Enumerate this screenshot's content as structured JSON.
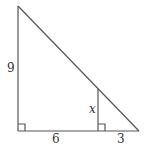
{
  "diagram": {
    "type": "geometry",
    "labels": {
      "left_leg": "9",
      "base_left": "6",
      "inner_segment": "x",
      "base_right": "3"
    },
    "line_color": "#555555",
    "right_angle_marks": 2
  }
}
